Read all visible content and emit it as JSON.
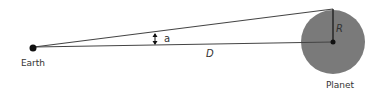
{
  "diagram": {
    "type": "geometry",
    "labels": {
      "earth": "Earth",
      "planet": "Planet",
      "angle": "a",
      "distance": "D",
      "radius": "R"
    },
    "colors": {
      "planet_fill": "#7a7a7a",
      "line": "#444444",
      "text": "#333333",
      "dot": "#111111"
    }
  }
}
